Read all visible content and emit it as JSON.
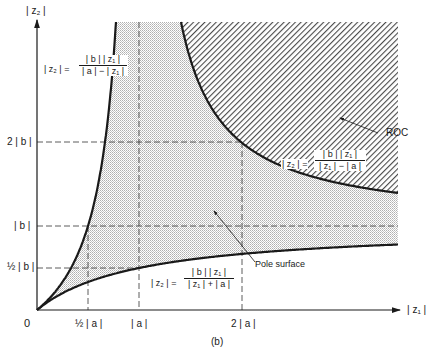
{
  "figure": {
    "caption": "(b)",
    "y_axis_label": "| z₂ |",
    "x_axis_label": "| z₁ |",
    "origin_label": "0",
    "x_ticks": [
      {
        "label": "½ | a |",
        "value": 0.5
      },
      {
        "label": "| a |",
        "value": 1
      },
      {
        "label": "2 | a |",
        "value": 2
      }
    ],
    "y_ticks": [
      {
        "label": "½ | b |",
        "value": 0.5
      },
      {
        "label": "| b |",
        "value": 1
      },
      {
        "label": "2 | b |",
        "value": 2
      }
    ],
    "equations": {
      "left_curve": {
        "lhs": "| z₂ | =",
        "num": "| b | | z₁ |",
        "den": "| a | − | z₁ |"
      },
      "right_curve": {
        "lhs": "| z₂ | =",
        "num": "| b | | z₁ |",
        "den": "| z₁ | − | a |"
      },
      "bottom_curve": {
        "lhs": "| z₂ | =",
        "num": "| b | | z₁ |",
        "den": "| z₁ | + | a |"
      }
    },
    "region_labels": {
      "roc": "ROC",
      "pole_surface": "Pole surface"
    },
    "colors": {
      "line": "#1a1a1a",
      "hatch": "#555555",
      "stipple": "#bdbdbd",
      "background": "#ffffff"
    }
  }
}
